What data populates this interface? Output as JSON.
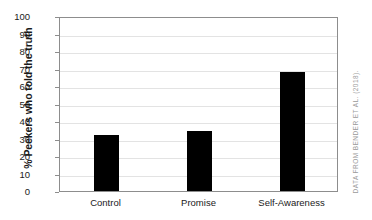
{
  "chart_data": {
    "type": "bar",
    "title": "",
    "subtitle": "",
    "xlabel": "",
    "ylabel": "% Peekers who told the truth",
    "categories": [
      "Control",
      "Promise",
      "Self-Awareness"
    ],
    "values": [
      32,
      34.5,
      68
    ],
    "series": [
      {
        "name": "% Peekers who told the truth",
        "values": [
          32,
          34.5,
          68
        ]
      }
    ],
    "ylim": [
      0,
      100
    ],
    "ytick_labels": [
      "0",
      "10",
      "20",
      "30",
      "40",
      "50",
      "60",
      "70",
      "80",
      "90",
      "100"
    ],
    "ytick_values": [
      0,
      10,
      20,
      30,
      40,
      50,
      60,
      70,
      80,
      90,
      100
    ],
    "ytick_step": 10,
    "grid": true,
    "grid_axis": "y",
    "legend": false,
    "legend_position": "none",
    "bar_color": "#000000",
    "grid_color": "#e3e3e3",
    "frame_color": "#8d8d8d",
    "background_color": "#ffffff",
    "text_color": "#1a1a1a"
  },
  "annotations": {
    "source_note": "DATA FROM BENDER ET AL. (2018).",
    "source_note_color": "#9a9a9a"
  }
}
